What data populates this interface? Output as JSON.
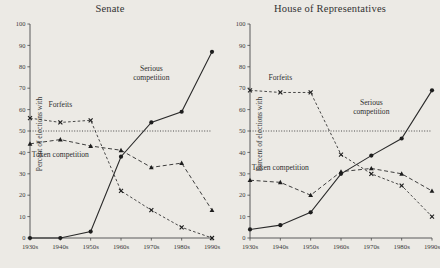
{
  "figure": {
    "background_color": "#eceae5",
    "ink_color": "#2b2b2b",
    "y_axis_label": "Percent of elections with",
    "reference_line_value": 50,
    "series_names": {
      "serious": "Serious competition",
      "token": "Token competition",
      "forfeits": "Forfeits"
    }
  },
  "chart_data": [
    {
      "type": "line",
      "title": "Senate",
      "xlabel": "",
      "ylabel": "Percent of elections with",
      "categories": [
        "1930s",
        "1940s",
        "1950s",
        "1960s",
        "1970s",
        "1980s",
        "1990s"
      ],
      "ylim": [
        0,
        100
      ],
      "yticks": [
        0,
        10,
        20,
        30,
        40,
        50,
        60,
        70,
        80,
        90,
        100
      ],
      "grid": false,
      "reference_line": 50,
      "legend_position": "inline-annotations",
      "annotations": [
        {
          "text": "Forfeits",
          "x_category": "1940s",
          "y_value": 61
        },
        {
          "text": "Serious competition",
          "x_category": "1970s",
          "y_value": 78
        },
        {
          "text": "Token competition",
          "x_category": "1940s",
          "y_value": 38
        }
      ],
      "series": [
        {
          "name": "Serious competition",
          "marker": "circle",
          "linestyle": "solid",
          "values": [
            0,
            0,
            3,
            38,
            54,
            59,
            87
          ]
        },
        {
          "name": "Token competition",
          "marker": "triangle",
          "linestyle": "dashed",
          "values": [
            44,
            46,
            43,
            41,
            33,
            35,
            13
          ]
        },
        {
          "name": "Forfeits",
          "marker": "x",
          "linestyle": "dotted",
          "values": [
            56,
            54,
            55,
            22,
            13,
            5,
            0
          ]
        }
      ]
    },
    {
      "type": "line",
      "title": "House of Representatives",
      "xlabel": "",
      "ylabel": "Percent of elections with",
      "categories": [
        "1930s",
        "1940s",
        "1950s",
        "1960s",
        "1970s",
        "1980s",
        "1990s"
      ],
      "ylim": [
        0,
        100
      ],
      "yticks": [
        0,
        10,
        20,
        30,
        40,
        50,
        60,
        70,
        80,
        90,
        100
      ],
      "grid": false,
      "reference_line": 50,
      "legend_position": "inline-annotations",
      "annotations": [
        {
          "text": "Forfeits",
          "x_category": "1940s",
          "y_value": 74
        },
        {
          "text": "Serious competition",
          "x_category": "1970s",
          "y_value": 62
        },
        {
          "text": "Token competition",
          "x_category": "1940s",
          "y_value": 32
        }
      ],
      "series": [
        {
          "name": "Serious competition",
          "marker": "circle",
          "linestyle": "solid",
          "values": [
            4,
            6,
            12,
            30,
            38.5,
            46.5,
            69
          ]
        },
        {
          "name": "Token competition",
          "marker": "triangle",
          "linestyle": "dashed",
          "values": [
            27,
            26,
            20,
            31,
            32.5,
            30,
            22
          ]
        },
        {
          "name": "Forfeits",
          "marker": "x",
          "linestyle": "dotted",
          "values": [
            69,
            68,
            68,
            39,
            30,
            24.5,
            10
          ]
        }
      ]
    }
  ]
}
